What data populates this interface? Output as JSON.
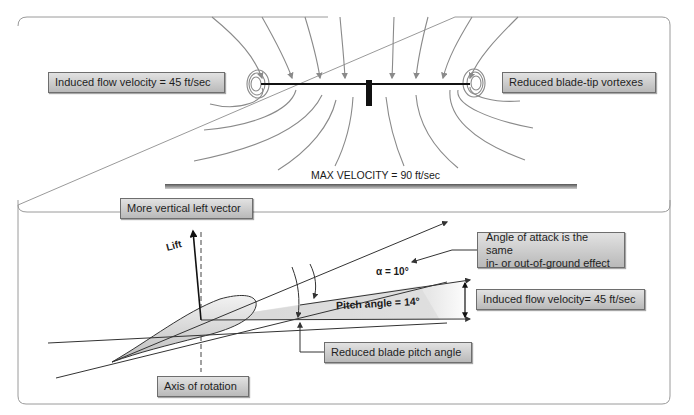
{
  "top_section": {
    "labels": {
      "induced_flow": "Induced flow velocity = 45 ft/sec",
      "blade_tip_vortexes": "Reduced blade-tip vortexes",
      "max_velocity": "MAX VELOCITY = 90 ft/sec"
    }
  },
  "bottom_section": {
    "labels": {
      "vertical_vector": "More vertical left vector",
      "lift": "Lift",
      "alpha": "α = 10°",
      "pitch_angle": "Pitch angle = 14°",
      "angle_of_attack_line1": "Angle of attack is the same",
      "angle_of_attack_line2": "in- or out-of-ground effect",
      "induced_flow": "Induced flow velocity= 45 ft/sec",
      "reduced_pitch": "Reduced blade pitch angle",
      "axis_of_rotation": "Axis of rotation"
    }
  },
  "colors": {
    "frame_border": "#9a9a9a",
    "flow_lines": "#8a8a8a",
    "blade": "#111111",
    "label_fill_top": "#e2e2e2",
    "label_fill_bottom": "#b9b9b9",
    "airfoil_fill": "#d8d8d8"
  }
}
